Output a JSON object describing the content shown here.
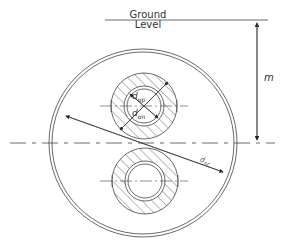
{
  "labels": {
    "ground_line1": "Ground",
    "ground_line2": "Level",
    "depth": "m",
    "outer_pipe_diameter_base": "d",
    "outer_pipe_diameter_sub": "op",
    "inner_pipe_diameter_base": "d",
    "inner_pipe_diameter_sub": "on",
    "sleeve_diameter_base": "d",
    "sleeve_diameter_sub": "sc"
  },
  "geometry": {
    "sleeve": {
      "cx": 143,
      "cy": 143,
      "r_outer": 94,
      "r_inner": 91
    },
    "upper_pipe": {
      "cx": 144,
      "cy": 106,
      "r_insulation": 33,
      "r_pipe_outer": 20,
      "r_pipe_inner": 17
    },
    "lower_pipe": {
      "cx": 145,
      "cy": 181,
      "r_insulation": 33,
      "r_pipe_outer": 20,
      "r_pipe_inner": 17
    },
    "ground_level_y": 20,
    "centerline_y": 143
  },
  "colors": {
    "line": "#444444",
    "text": "#333333",
    "background": "#ffffff"
  }
}
